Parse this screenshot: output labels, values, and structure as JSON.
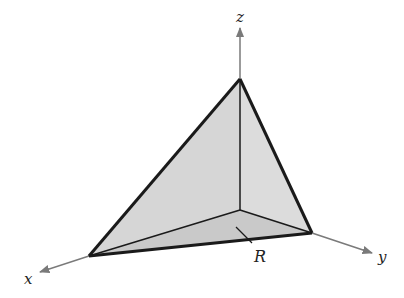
{
  "diagram": {
    "type": "3d-tetrahedron-region",
    "axes": {
      "x": {
        "label": "x"
      },
      "y": {
        "label": "y"
      },
      "z": {
        "label": "z"
      }
    },
    "region_label": "R",
    "colors": {
      "face_fill": "#d4d4d4",
      "base_fill": "#c8c8c8",
      "edge": "#1a1a1a",
      "axis": "#7a7a7a"
    }
  }
}
